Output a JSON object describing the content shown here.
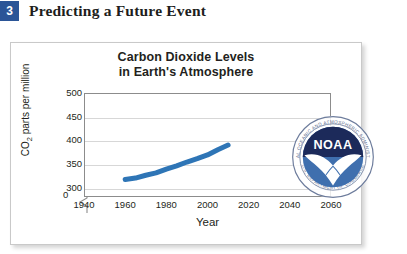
{
  "section": {
    "number": "3",
    "title": "Predicting a Future Event"
  },
  "figure": {
    "logo": {
      "name": "noaa-seal",
      "acronym": "NOAA",
      "ring_text_top": "NATIONAL OCEANIC AND ATMOSPHERIC ADMINISTRATION",
      "ring_text_bottom": "U.S. DEPARTMENT OF COMMERCE",
      "colors": {
        "dark_navy": "#1c2a5a",
        "mid_blue": "#3f6fae",
        "ring": "#5a6d92",
        "text": "#ffffff"
      }
    }
  },
  "chart_data": {
    "type": "line",
    "title": "Carbon Dioxide Levels in Earth's Atmosphere",
    "title_line1": "Carbon Dioxide Levels",
    "title_line2": "in Earth's Atmosphere",
    "xlabel": "Year",
    "ylabel": "CO2 parts per million",
    "ylabel_prefix": "CO",
    "ylabel_sub": "2",
    "ylabel_suffix": " parts per million",
    "xlim": [
      1940,
      2060
    ],
    "ylim": [
      280,
      500
    ],
    "y_axis_break": true,
    "y_break_label": "0",
    "grid": true,
    "grid_axis": "y",
    "legend": "none",
    "xticks": [
      1940,
      1960,
      1980,
      2000,
      2020,
      2040,
      2060
    ],
    "xtick_labels": [
      "1940",
      "1960",
      "1980",
      "2000",
      "2020",
      "2040",
      "2060"
    ],
    "yticks": [
      300,
      350,
      400,
      450,
      500
    ],
    "ytick_labels": [
      "300",
      "350",
      "400",
      "450",
      "500"
    ],
    "series": [
      {
        "name": "Measured CO2 concentration",
        "color": "#2e75b6",
        "line_width": 5,
        "x": [
          1960,
          1965,
          1970,
          1975,
          1980,
          1985,
          1990,
          1995,
          2000,
          2005,
          2010
        ],
        "values": [
          317,
          320,
          326,
          331,
          339,
          346,
          354,
          361,
          369,
          380,
          390
        ]
      }
    ]
  }
}
